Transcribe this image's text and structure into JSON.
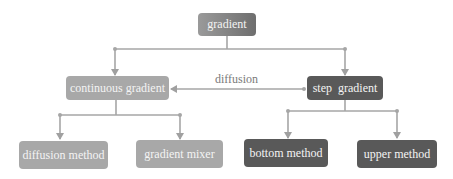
{
  "diagram": {
    "root": {
      "label": "gradient"
    },
    "level1": [
      {
        "label": "continuous gradient",
        "style": "light"
      },
      {
        "label": "step  gradient",
        "style": "dark"
      }
    ],
    "level2": [
      {
        "label": "diffusion method",
        "parent": "continuous gradient",
        "style": "light"
      },
      {
        "label": "gradient mixer",
        "parent": "continuous gradient",
        "style": "light"
      },
      {
        "label": "bottom method",
        "parent": "step gradient",
        "style": "dark"
      },
      {
        "label": "upper method",
        "parent": "step gradient",
        "style": "dark"
      }
    ],
    "edges": [
      {
        "from": "gradient",
        "to": "continuous gradient"
      },
      {
        "from": "gradient",
        "to": "step gradient"
      },
      {
        "from": "step gradient",
        "to": "continuous gradient",
        "label": "diffusion"
      },
      {
        "from": "continuous gradient",
        "to": "diffusion method"
      },
      {
        "from": "continuous gradient",
        "to": "gradient mixer"
      },
      {
        "from": "step gradient",
        "to": "bottom method"
      },
      {
        "from": "step gradient",
        "to": "upper method"
      }
    ],
    "edge_label": "diffusion",
    "colors": {
      "light_node": "#a8a8a8",
      "dark_node": "#595959",
      "line": "#a0a0a0",
      "text": "#f4f4f4"
    }
  }
}
